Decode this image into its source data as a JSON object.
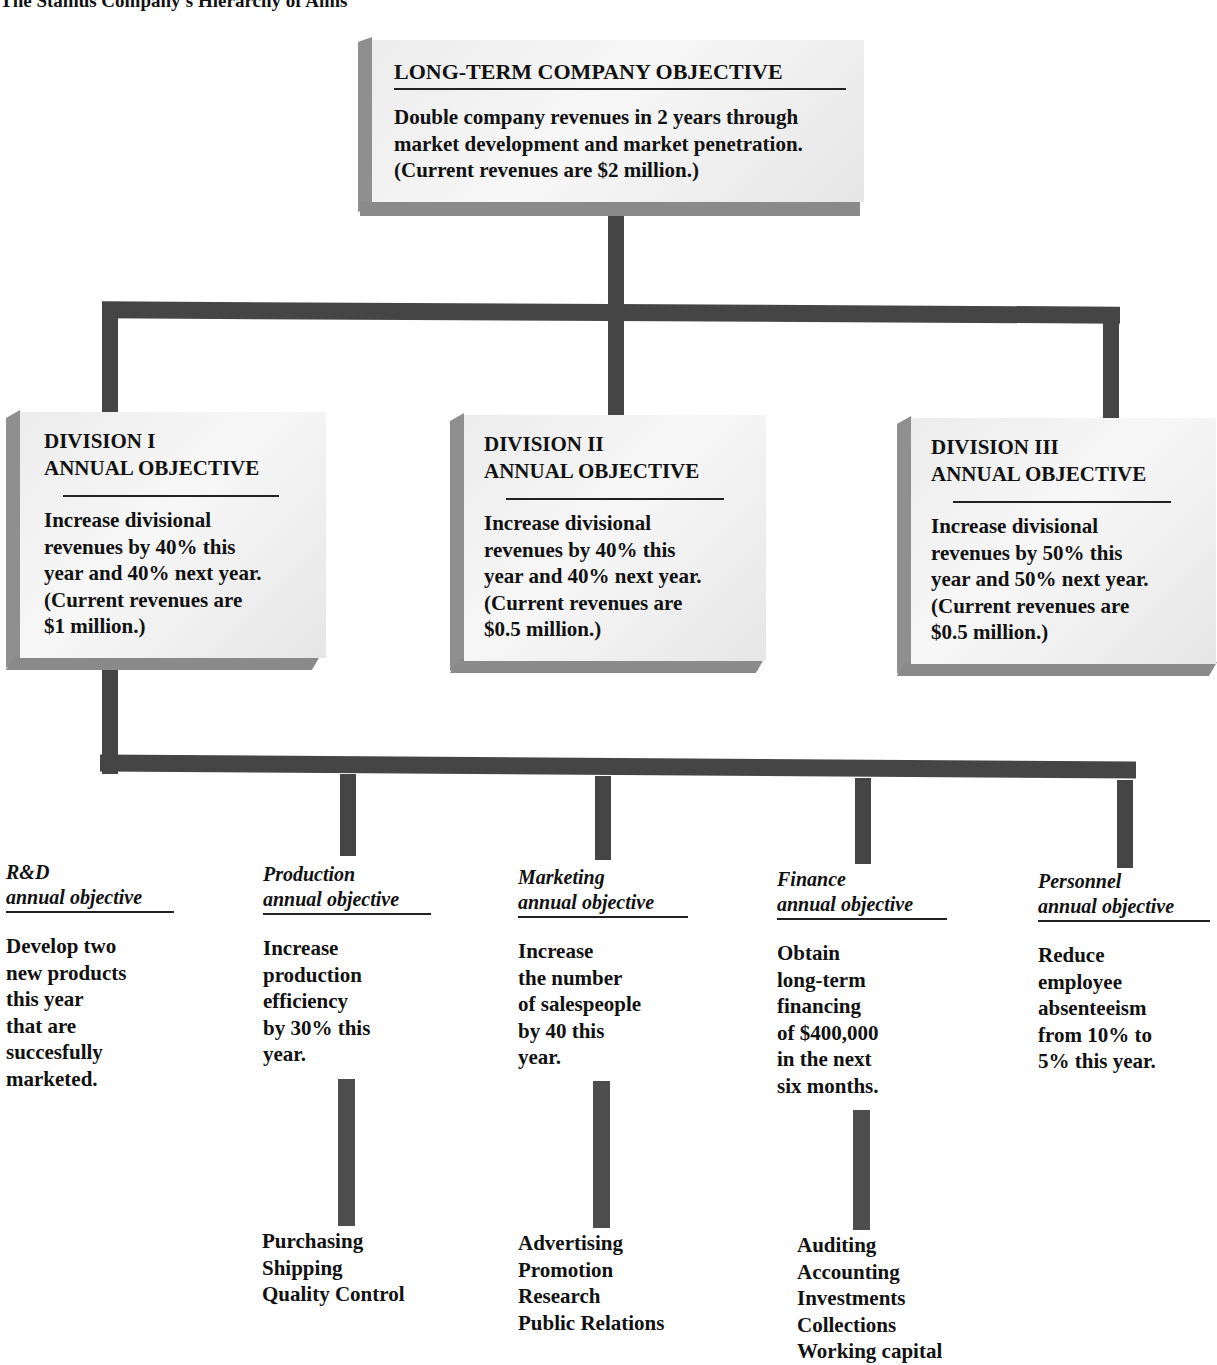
{
  "title": "The Stanius Company's Hierarchy of Aims",
  "company": {
    "heading": "LONG-TERM COMPANY OBJECTIVE",
    "lines": [
      "Double company revenues in 2 years through",
      "market development and market penetration.",
      "(Current revenues are $2 million.)"
    ]
  },
  "divisions": [
    {
      "heading_line1": "DIVISION  I",
      "heading_line2": "ANNUAL OBJECTIVE",
      "lines": [
        "Increase divisional",
        "revenues by 40% this",
        "year and 40% next year.",
        "(Current revenues are",
        "$1 million.)"
      ]
    },
    {
      "heading_line1": "DIVISION  II",
      "heading_line2": "ANNUAL OBJECTIVE",
      "lines": [
        "Increase divisional",
        "revenues by 40% this",
        "year and 40% next year.",
        "(Current revenues are",
        "$0.5 million.)"
      ]
    },
    {
      "heading_line1": "DIVISION  III",
      "heading_line2": "ANNUAL OBJECTIVE",
      "lines": [
        "Increase divisional",
        "revenues by 50% this",
        "year and 50% next year.",
        "(Current revenues are",
        "$0.5 million.)"
      ]
    }
  ],
  "departments": [
    {
      "name": "R&D",
      "sub": "annual objective",
      "lines": [
        "Develop two",
        "new products",
        "this year",
        "that are",
        "succesfully",
        "marketed."
      ],
      "tasks": []
    },
    {
      "name": "Production",
      "sub": "annual objective",
      "lines": [
        "Increase",
        "production",
        "efficiency",
        "by 30% this",
        "year."
      ],
      "tasks": [
        "Purchasing",
        "Shipping",
        "Quality Control"
      ]
    },
    {
      "name": "Marketing",
      "sub": "annual objective",
      "lines": [
        "Increase",
        "the number",
        "of salespeople",
        "by 40 this",
        "year."
      ],
      "tasks": [
        "Advertising",
        "Promotion",
        "Research",
        "Public Relations"
      ]
    },
    {
      "name": "Finance",
      "sub": "annual objective",
      "lines": [
        "Obtain",
        "long-term",
        "financing",
        "of $400,000",
        "in the next",
        "six months."
      ],
      "tasks": [
        "Auditing",
        "Accounting",
        "Investments",
        "Collections",
        "Working capital"
      ]
    },
    {
      "name": "Personnel",
      "sub": "annual objective",
      "lines": [
        "Reduce",
        "employee",
        "absenteeism",
        "from 10% to",
        "5% this year."
      ],
      "tasks": []
    }
  ],
  "colors": {
    "connector": "#454545",
    "box_face": "#f0f0f0",
    "box_shadow": "#8f8f8f",
    "text": "#111111"
  }
}
